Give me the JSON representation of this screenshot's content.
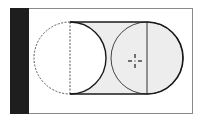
{
  "diagram": {
    "colors": {
      "background": "#ffffff",
      "frame": "#8a8a8a",
      "side_bar": "#1e1e1e",
      "swept_fill": "#ededed",
      "stroke": "#1a1a1a",
      "dashed": "#555555"
    },
    "shapes": {
      "start_circle": {
        "cx": 70,
        "cy": 58,
        "r": 36,
        "style": "dashed-left-half"
      },
      "end_circle": {
        "cx": 147,
        "cy": 58,
        "r": 36,
        "style": "solid"
      },
      "crosshair": {
        "x": 135,
        "y": 61
      }
    }
  }
}
